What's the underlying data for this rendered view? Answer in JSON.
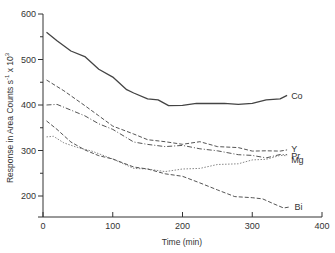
{
  "chart_data": {
    "type": "line",
    "title": "",
    "xlabel": "Time (min)",
    "ylabel": "Response in Area Counts s⁻¹ x 10³",
    "xlim": [
      0,
      400
    ],
    "ylim": [
      150,
      600
    ],
    "xticks": [
      0,
      100,
      200,
      300,
      400
    ],
    "yticks": [
      200,
      300,
      400,
      500,
      600
    ],
    "grid": false,
    "legend": "inline labels at right end of each line",
    "series": [
      {
        "name": "Co",
        "style": "solid",
        "x": [
          5,
          20,
          40,
          60,
          80,
          100,
          120,
          130,
          150,
          165,
          180,
          200,
          220,
          240,
          260,
          280,
          300,
          320,
          340,
          350
        ],
        "y": [
          560,
          540,
          520,
          505,
          480,
          460,
          435,
          425,
          415,
          410,
          400,
          398,
          405,
          402,
          405,
          400,
          405,
          410,
          415,
          420
        ]
      },
      {
        "name": "Y",
        "style": "dashed",
        "x": [
          5,
          30,
          60,
          80,
          100,
          130,
          150,
          175,
          200,
          225,
          250,
          280,
          300,
          320,
          340,
          350
        ],
        "y": [
          455,
          430,
          400,
          375,
          355,
          335,
          325,
          318,
          315,
          318,
          310,
          305,
          300,
          298,
          300,
          300
        ]
      },
      {
        "name": "Pr",
        "style": "dash-dot",
        "x": [
          5,
          20,
          40,
          60,
          80,
          100,
          130,
          150,
          175,
          200,
          225,
          250,
          280,
          300,
          320,
          340,
          350
        ],
        "y": [
          400,
          400,
          390,
          375,
          360,
          345,
          320,
          312,
          310,
          310,
          305,
          298,
          292,
          288,
          285,
          290,
          292
        ]
      },
      {
        "name": "Mg",
        "style": "dotted",
        "x": [
          5,
          15,
          30,
          50,
          70,
          100,
          130,
          150,
          175,
          200,
          225,
          250,
          280,
          300,
          320,
          340,
          350
        ],
        "y": [
          330,
          330,
          318,
          305,
          300,
          280,
          262,
          258,
          255,
          258,
          262,
          268,
          272,
          278,
          282,
          288,
          290
        ]
      },
      {
        "name": "Bi",
        "style": "dashed",
        "x": [
          5,
          20,
          40,
          60,
          80,
          100,
          130,
          150,
          175,
          200,
          225,
          250,
          275,
          300,
          315,
          330,
          345,
          355
        ],
        "y": [
          365,
          345,
          320,
          300,
          290,
          280,
          265,
          258,
          250,
          242,
          230,
          212,
          200,
          195,
          195,
          182,
          175,
          175
        ]
      }
    ]
  },
  "labels": {
    "xlabel": "Time (min)",
    "ylabel": "Response in Area Counts s",
    "ylabel_sup1": "-1",
    "ylabel_mid": " x 10",
    "ylabel_sup2": "3",
    "xtick_labels": [
      "0",
      "100",
      "200",
      "300",
      "400"
    ],
    "ytick_labels": [
      "200",
      "300",
      "400",
      "500",
      "600"
    ],
    "series_labels": [
      "Co",
      "Y",
      "Pr",
      "Mg",
      "Bi"
    ]
  }
}
